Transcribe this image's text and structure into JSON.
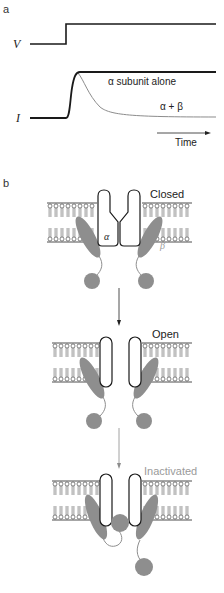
{
  "panels": {
    "a": {
      "label": "a",
      "voltage_label": "V",
      "current_label": "I",
      "trace_alpha_label": "α subunit alone",
      "trace_alpha_beta_label": "α + β",
      "time_axis_label": "Time"
    },
    "b": {
      "label": "b",
      "states": [
        {
          "label": "Closed",
          "color": "#222222"
        },
        {
          "label": "Open",
          "color": "#222222"
        },
        {
          "label": "Inactivated",
          "color": "#9a9a9a"
        }
      ],
      "alpha_label": "α",
      "beta_label": "β"
    }
  },
  "colors": {
    "line_dark": "#1a1a1a",
    "line_gray": "#8c8c8c",
    "subunit_gray": "#8e8e8e",
    "inactivated_text": "#9a9a9a"
  }
}
